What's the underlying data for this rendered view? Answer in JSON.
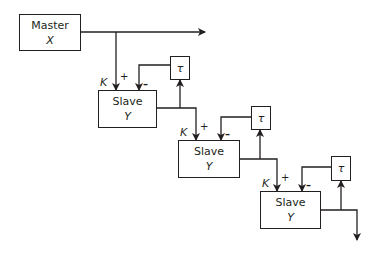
{
  "diagram": {
    "type": "master-slave cascade",
    "colors": {
      "stroke": "#231f20",
      "background": "#ffffff"
    },
    "master": {
      "label": "Master",
      "variable": "X"
    },
    "slaves": [
      {
        "label": "Slave",
        "variable": "Y",
        "gain": "K",
        "plus": "+",
        "minus": "–",
        "delay": "τ"
      },
      {
        "label": "Slave",
        "variable": "Y",
        "gain": "K",
        "plus": "+",
        "minus": "–",
        "delay": "τ"
      },
      {
        "label": "Slave",
        "variable": "Y",
        "gain": "K",
        "plus": "+",
        "minus": "–",
        "delay": "τ"
      }
    ]
  }
}
